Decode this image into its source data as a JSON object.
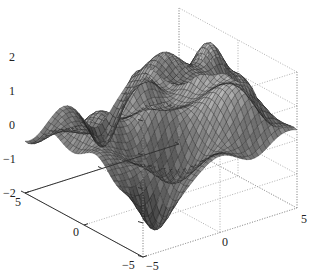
{
  "chart_data": {
    "type": "surface",
    "title": "",
    "xlabel": "",
    "ylabel": "",
    "zlabel": "",
    "xlim": [
      -5,
      5
    ],
    "ylim": [
      -5,
      5
    ],
    "zlim": [
      -2,
      2
    ],
    "grid": true,
    "colormap": "gray",
    "x_ticks": [
      -5,
      0,
      5
    ],
    "y_ticks": [
      -5,
      0,
      5
    ],
    "z_ticks": [
      -2,
      -1,
      0,
      1,
      2
    ],
    "mesh_resolution": 41,
    "surface_components": [
      {
        "x": -1.0,
        "y": 4.0,
        "amp": 1.9,
        "sigma": 0.9
      },
      {
        "x": -3.5,
        "y": 3.0,
        "amp": 1.3,
        "sigma": 0.9
      },
      {
        "x": -2.5,
        "y": 0.5,
        "amp": 1.2,
        "sigma": 0.9
      },
      {
        "x": 1.5,
        "y": 2.5,
        "amp": 1.4,
        "sigma": 1.2
      },
      {
        "x": 0.0,
        "y": -0.5,
        "amp": 1.0,
        "sigma": 0.9
      },
      {
        "x": 3.5,
        "y": 3.5,
        "amp": 0.9,
        "sigma": 0.9
      },
      {
        "x": 4.0,
        "y": -3.5,
        "amp": -1.6,
        "sigma": 0.8
      },
      {
        "x": -4.0,
        "y": -0.5,
        "amp": -1.2,
        "sigma": 0.8
      },
      {
        "x": 2.0,
        "y": -1.0,
        "amp": -1.0,
        "sigma": 0.9
      },
      {
        "x": -1.0,
        "y": -3.5,
        "amp": 0.8,
        "sigma": 0.9
      },
      {
        "x": 1.0,
        "y": 4.5,
        "amp": 0.5,
        "sigma": 0.7
      },
      {
        "x": -4.5,
        "y": -4.5,
        "amp": -0.3,
        "sigma": 1.0
      }
    ]
  },
  "axes": {
    "z_tick_labels": [
      "2",
      "1",
      "0",
      "−1",
      "−2"
    ],
    "x_tick_labels": [
      "5",
      "0",
      "−5"
    ],
    "y_tick_labels": [
      "−5",
      "0",
      "5"
    ]
  }
}
